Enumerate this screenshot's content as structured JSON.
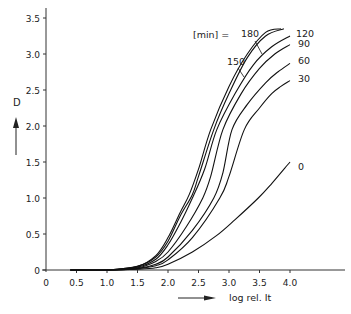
{
  "chart_data": {
    "type": "line",
    "title": "",
    "xlabel": "log rel. It",
    "ylabel": "D",
    "xlim": [
      0,
      4.6
    ],
    "ylim": [
      0,
      3.55
    ],
    "grid": false,
    "x_ticks": [
      "0",
      "0.5",
      "1.0",
      "1.5",
      "2.0",
      "2.5",
      "3.0",
      "3.5",
      "4.0"
    ],
    "y_ticks": [
      "0",
      "0.5",
      "1.0",
      "1.5",
      "2.0",
      "2.5",
      "3.0",
      "3.5"
    ],
    "legend_title": "[min] =",
    "series": [
      {
        "name": "180",
        "x": [
          0.4,
          1.0,
          1.5,
          1.8,
          2.0,
          2.2,
          2.35,
          2.5,
          2.7,
          3.0,
          3.3,
          3.6,
          3.85
        ],
        "y": [
          0.0,
          0.0,
          0.05,
          0.2,
          0.45,
          0.8,
          1.05,
          1.4,
          1.95,
          2.55,
          3.0,
          3.3,
          3.35
        ]
      },
      {
        "name": "150",
        "x": [
          0.4,
          1.0,
          1.5,
          1.8,
          2.0,
          2.2,
          2.4,
          2.5,
          2.75,
          3.0,
          3.3,
          3.6,
          3.9
        ],
        "y": [
          0.0,
          0.0,
          0.05,
          0.18,
          0.4,
          0.75,
          1.05,
          1.3,
          1.95,
          2.45,
          2.95,
          3.25,
          3.35
        ]
      },
      {
        "name": "120",
        "x": [
          0.4,
          1.0,
          1.5,
          1.8,
          2.0,
          2.2,
          2.4,
          2.6,
          2.8,
          3.1,
          3.4,
          3.7,
          4.0
        ],
        "y": [
          0.0,
          0.0,
          0.04,
          0.15,
          0.35,
          0.65,
          1.0,
          1.4,
          1.95,
          2.45,
          2.85,
          3.1,
          3.25
        ]
      },
      {
        "name": "90",
        "x": [
          0.4,
          1.0,
          1.5,
          1.8,
          2.0,
          2.3,
          2.57,
          2.7,
          2.9,
          3.2,
          3.5,
          3.75,
          4.0
        ],
        "y": [
          0.0,
          0.0,
          0.03,
          0.12,
          0.25,
          0.6,
          1.0,
          1.3,
          1.95,
          2.45,
          2.8,
          3.0,
          3.13
        ]
      },
      {
        "name": "60",
        "x": [
          0.4,
          1.0,
          1.5,
          1.8,
          2.0,
          2.4,
          2.75,
          2.9,
          3.05,
          3.3,
          3.6,
          3.8,
          4.0
        ],
        "y": [
          0.0,
          0.0,
          0.02,
          0.08,
          0.18,
          0.55,
          1.0,
          1.35,
          1.95,
          2.3,
          2.6,
          2.75,
          2.87
        ]
      },
      {
        "name": "30",
        "x": [
          0.4,
          1.0,
          1.5,
          1.8,
          2.0,
          2.4,
          2.85,
          3.0,
          3.25,
          3.5,
          3.7,
          3.85,
          4.0
        ],
        "y": [
          0.0,
          0.0,
          0.02,
          0.06,
          0.14,
          0.45,
          1.0,
          1.3,
          1.95,
          2.25,
          2.45,
          2.55,
          2.63
        ]
      },
      {
        "name": "0",
        "x": [
          0.4,
          1.0,
          1.5,
          1.8,
          2.0,
          2.4,
          2.8,
          3.1,
          3.48,
          3.7,
          4.0
        ],
        "y": [
          0.0,
          0.0,
          0.01,
          0.03,
          0.08,
          0.25,
          0.48,
          0.7,
          1.0,
          1.2,
          1.5
        ]
      }
    ],
    "annotations": [
      {
        "text": "[min] =",
        "role": "legend-title"
      },
      {
        "text": "180",
        "series": "180"
      },
      {
        "text": "150",
        "series": "150"
      },
      {
        "text": "120",
        "series": "120"
      },
      {
        "text": "90",
        "series": "90"
      },
      {
        "text": "60",
        "series": "60"
      },
      {
        "text": "30",
        "series": "30"
      },
      {
        "text": "0",
        "series": "0"
      }
    ]
  },
  "labels": {
    "ylabel": "D",
    "xlabel": "log rel. It",
    "legend_title": "[min] =",
    "curve_180": "180",
    "curve_150": "150",
    "curve_120": "120",
    "curve_90": "90",
    "curve_60": "60",
    "curve_30": "30",
    "curve_0": "0"
  }
}
